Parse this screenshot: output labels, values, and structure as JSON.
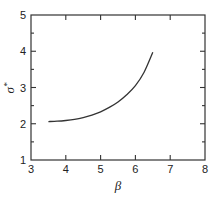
{
  "chart_data": {
    "type": "line",
    "title": "",
    "xlabel": "β",
    "ylabel": "σ*",
    "xlim": [
      3,
      8
    ],
    "ylim": [
      1,
      5
    ],
    "xticks": [
      3,
      4,
      5,
      6,
      7,
      8
    ],
    "yticks": [
      1,
      2,
      3,
      4,
      5
    ],
    "y_minor_step": 0.5,
    "grid": false,
    "legend": null,
    "series": [
      {
        "name": "σ*",
        "color": "#333333",
        "x": [
          3.5,
          3.75,
          4.0,
          4.25,
          4.5,
          4.75,
          5.0,
          5.25,
          5.5,
          5.75,
          6.0,
          6.25,
          6.5
        ],
        "y": [
          2.06,
          2.07,
          2.09,
          2.12,
          2.17,
          2.24,
          2.33,
          2.45,
          2.6,
          2.8,
          3.05,
          3.42,
          3.97
        ]
      }
    ]
  },
  "axes": {
    "x_label": "β",
    "y_label_base": "σ",
    "y_label_sup": "*",
    "x_tick_labels": [
      "3",
      "4",
      "5",
      "6",
      "7",
      "8"
    ],
    "y_tick_labels": [
      "1",
      "2",
      "3",
      "4",
      "5"
    ]
  },
  "colors": {
    "axis": "#333333",
    "line": "#333333",
    "background": "#ffffff"
  }
}
